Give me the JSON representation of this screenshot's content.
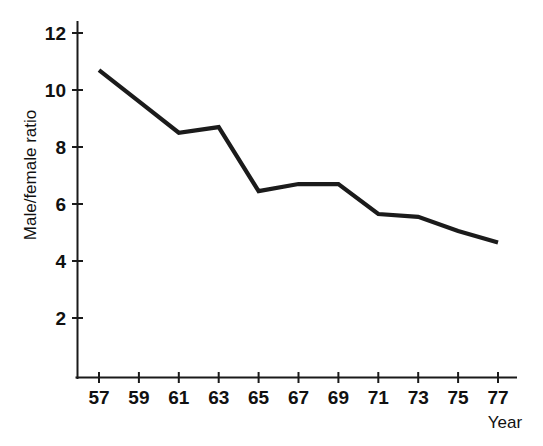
{
  "chart_data": {
    "type": "line",
    "title": "",
    "xlabel": "Year",
    "ylabel": "Male/female ratio",
    "x": [
      57,
      59,
      61,
      63,
      65,
      67,
      69,
      71,
      73,
      75,
      77
    ],
    "values": [
      10.7,
      9.6,
      8.5,
      8.7,
      6.45,
      6.7,
      6.7,
      5.65,
      5.55,
      5.05,
      4.65
    ],
    "xticklabels": [
      "57",
      "59",
      "61",
      "63",
      "65",
      "67",
      "69",
      "71",
      "73",
      "75",
      "77"
    ],
    "yticks": [
      2,
      4,
      6,
      8,
      10,
      12
    ],
    "yticklabels": [
      "2",
      "4",
      "6",
      "8",
      "10",
      "12"
    ],
    "xlim": [
      56,
      78
    ],
    "ylim": [
      0.6,
      12.6
    ],
    "grid": false,
    "legend": null,
    "series_color": "#1b1b1b"
  }
}
